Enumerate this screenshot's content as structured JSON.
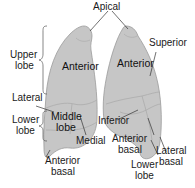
{
  "diagram": {
    "type": "anatomical-diagram",
    "colors": {
      "lung_fill": "#c6c6c6",
      "lung_outline": "#9a9a9a",
      "segment_lines": "#a8a8a8",
      "leader_lines": "#333333",
      "text": "#1a1a1a",
      "background": "#ffffff"
    },
    "labels": {
      "apical": "Apical",
      "upper_lobe_line1": "Upper",
      "upper_lobe_line2": "lobe",
      "lateral": "Lateral",
      "lower_lobe_left_line1": "Lower",
      "lower_lobe_left_line2": "lobe",
      "anterior_basal_left_line1": "Anterior",
      "anterior_basal_left_line2": "basal",
      "anterior_right_lung": "Anterior",
      "middle_lobe_line1": "Middle",
      "middle_lobe_line2": "lobe",
      "medial": "Medial",
      "anterior_left_lung": "Anterior",
      "superior": "Superior",
      "inferior": "Inferior",
      "anterior_basal_right_line1": "Anterior",
      "anterior_basal_right_line2": "basal",
      "lateral_basal_line1": "Lateral",
      "lateral_basal_line2": "basal",
      "lower_lobe_right_line1": "Lower",
      "lower_lobe_right_line2": "lobe"
    }
  }
}
